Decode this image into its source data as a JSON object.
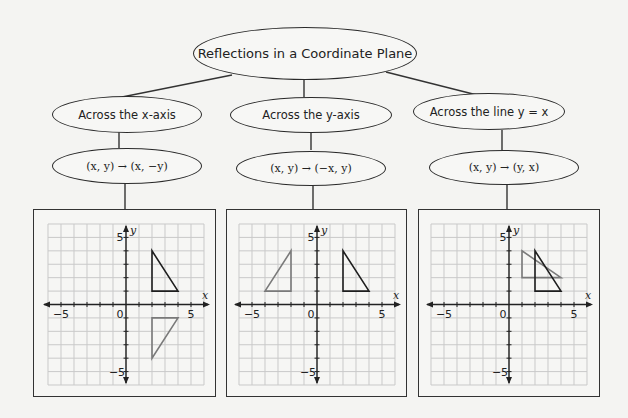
{
  "title": "Reflections in a Coordinate Plane",
  "branches": [
    {
      "id": "x-axis",
      "label": "Across the x-axis",
      "rule": "(x, y) → (x, −y)",
      "graph": {
        "x_range": [
          -6,
          6
        ],
        "y_range": [
          -6,
          6
        ],
        "tick_labels": {
          "x_neg": "−5",
          "x_pos": "5",
          "y_pos": "5",
          "y_neg": "−5",
          "origin": "0"
        },
        "axis_labels": {
          "x": "x",
          "y": "y"
        },
        "original": [
          [
            2,
            4
          ],
          [
            2,
            1
          ],
          [
            4,
            1
          ]
        ],
        "image": [
          [
            2,
            -4
          ],
          [
            2,
            -1
          ],
          [
            4,
            -1
          ]
        ]
      }
    },
    {
      "id": "y-axis",
      "label": "Across the y-axis",
      "rule": "(x, y) → (−x, y)",
      "graph": {
        "x_range": [
          -6,
          6
        ],
        "y_range": [
          -6,
          6
        ],
        "tick_labels": {
          "x_neg": "−5",
          "x_pos": "5",
          "y_pos": "5",
          "y_neg": "−5",
          "origin": "0"
        },
        "axis_labels": {
          "x": "x",
          "y": "y"
        },
        "original": [
          [
            2,
            4
          ],
          [
            2,
            1
          ],
          [
            4,
            1
          ]
        ],
        "image": [
          [
            -2,
            4
          ],
          [
            -2,
            1
          ],
          [
            -4,
            1
          ]
        ]
      }
    },
    {
      "id": "y-equals-x",
      "label": "Across the line y = x",
      "rule": "(x, y) → (y, x)",
      "graph": {
        "x_range": [
          -6,
          6
        ],
        "y_range": [
          -6,
          6
        ],
        "tick_labels": {
          "x_neg": "−5",
          "x_pos": "5",
          "y_pos": "5",
          "y_neg": "−5",
          "origin": "0"
        },
        "axis_labels": {
          "x": "x",
          "y": "y"
        },
        "original": [
          [
            2,
            4
          ],
          [
            2,
            1
          ],
          [
            4,
            1
          ]
        ],
        "image": [
          [
            4,
            2
          ],
          [
            1,
            2
          ],
          [
            1,
            4
          ]
        ]
      }
    }
  ],
  "colors": {
    "original_stroke": "#1e1e1e",
    "image_stroke": "#7a7a7a",
    "grid": "#c9c9c9",
    "axis": "#222222"
  }
}
